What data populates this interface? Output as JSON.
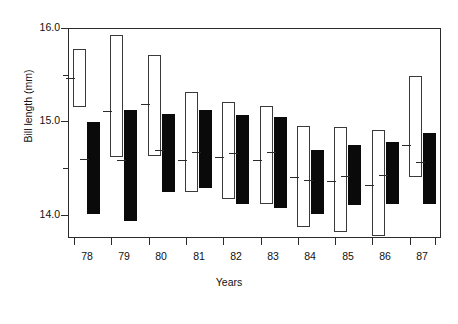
{
  "chart_data": {
    "type": "bar",
    "subtype": "range-bars-with-median",
    "title": "",
    "xlabel": "Years",
    "ylabel": "Bill length (mm)",
    "ylim": [
      13.75,
      16.0
    ],
    "ytick_labels": [
      "16.0",
      "15.0",
      "14.0"
    ],
    "ytick_values": [
      16.0,
      15.0,
      14.0
    ],
    "yminor_values": [
      15.5,
      14.5
    ],
    "grid": false,
    "legend": null,
    "categories": [
      "78",
      "79",
      "80",
      "81",
      "82",
      "83",
      "84",
      "85",
      "86",
      "87"
    ],
    "series": [
      {
        "name": "open",
        "style": "white-outlined",
        "ranges": [
          {
            "category": "78",
            "low": 15.16,
            "high": 15.79,
            "median": 15.48
          },
          {
            "category": "79",
            "low": 14.63,
            "high": 15.94,
            "median": 15.12
          },
          {
            "category": "80",
            "low": 14.64,
            "high": 15.72,
            "median": 15.2
          },
          {
            "category": "81",
            "low": 14.25,
            "high": 15.33,
            "median": 14.6
          },
          {
            "category": "82",
            "low": 14.18,
            "high": 15.22,
            "median": 14.63
          },
          {
            "category": "83",
            "low": 14.12,
            "high": 15.18,
            "median": 14.6
          },
          {
            "category": "84",
            "low": 13.88,
            "high": 14.96,
            "median": 14.41
          },
          {
            "category": "85",
            "low": 13.83,
            "high": 14.95,
            "median": 14.37
          },
          {
            "category": "86",
            "low": 13.78,
            "high": 14.92,
            "median": 14.33
          },
          {
            "category": "87",
            "low": 14.41,
            "high": 15.5,
            "median": 14.76
          }
        ]
      },
      {
        "name": "filled",
        "style": "black-solid",
        "ranges": [
          {
            "category": "78",
            "low": 14.02,
            "high": 15.0,
            "median": 14.61
          },
          {
            "category": "79",
            "low": 13.94,
            "high": 15.13,
            "median": 14.6
          },
          {
            "category": "80",
            "low": 14.25,
            "high": 15.09,
            "median": 14.7
          },
          {
            "category": "81",
            "low": 14.3,
            "high": 15.13,
            "median": 14.68
          },
          {
            "category": "82",
            "low": 14.12,
            "high": 15.08,
            "median": 14.67
          },
          {
            "category": "83",
            "low": 14.08,
            "high": 15.06,
            "median": 14.68
          },
          {
            "category": "84",
            "low": 14.02,
            "high": 14.7,
            "median": 14.38
          },
          {
            "category": "85",
            "low": 14.11,
            "high": 14.76,
            "median": 14.42
          },
          {
            "category": "86",
            "low": 14.12,
            "high": 14.79,
            "median": 14.44
          },
          {
            "category": "87",
            "low": 14.12,
            "high": 14.89,
            "median": 14.57
          }
        ]
      }
    ]
  },
  "axes": {
    "x_title": "Years",
    "y_title": "Bill length (mm)"
  }
}
